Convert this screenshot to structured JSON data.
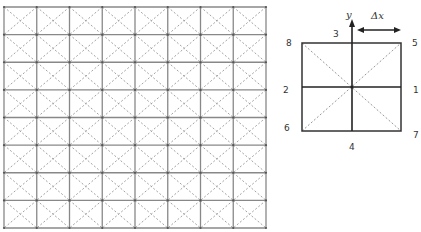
{
  "figure": {
    "left_panel": {
      "title": "Lattice grid",
      "rows": 8,
      "cols": 8,
      "x0": 4,
      "y0": 7,
      "x1": 266,
      "y1": 228,
      "grid_color": "#888888",
      "diagonal_color": "#999999",
      "diagonals": "dashed"
    },
    "right_panel": {
      "title": "D2Q9-style cell",
      "axis_label": "y",
      "spacing_label": "Δx",
      "node_labels": {
        "n1": "1",
        "n2": "2",
        "n3": "3",
        "n4": "4",
        "n5": "5",
        "n6": "6",
        "n7": "7",
        "n8": "8"
      }
    }
  }
}
